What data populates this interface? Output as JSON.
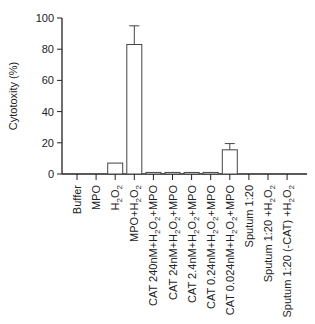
{
  "chart_data": {
    "type": "bar",
    "title": "",
    "xlabel": "",
    "ylabel": "Cytotoxity (%)",
    "ylim": [
      0,
      100
    ],
    "yticks": [
      0,
      20,
      40,
      60,
      80,
      100
    ],
    "grid": false,
    "categories": [
      "Buffer",
      "MPO",
      "H2O2",
      "MPO+H2O2",
      "CAT 240nM+H2O2+MPO",
      "CAT 24nM+H2O2+MPO",
      "CAT 2.4nM+H2O2+MPO",
      "CAT 0.24nM+H2O2+MPO",
      "CAT 0.024nM+H2O2+MPO",
      "Sputum 1:20",
      "Sputum 1:20 +H2O2",
      "Sputum 1:20 (-CAT) +H2O2"
    ],
    "values": [
      0,
      0,
      7,
      83,
      1,
      1,
      1,
      1,
      15.5,
      0,
      0,
      0
    ],
    "error_upper": [
      null,
      null,
      null,
      12,
      null,
      null,
      null,
      null,
      4,
      null,
      null,
      null
    ]
  }
}
